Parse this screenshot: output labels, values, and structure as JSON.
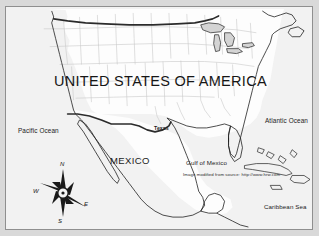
{
  "slide": {
    "background_color": "#d9d9d9",
    "plate_color": "#f2f2f2",
    "frame_color": "#8f8f8f"
  },
  "map": {
    "title": "UNITED STATES OF AMERICA",
    "countries": [
      {
        "name": "UNITED STATES OF AMERICA"
      },
      {
        "name": "MEXICO"
      }
    ],
    "country_usa": "UNITED STATES OF AMERICA",
    "country_mexico": "MEXICO",
    "state_label": "Texas",
    "water_bodies": {
      "pacific": "Pacific Ocean",
      "atlantic": "Atlantic Ocean",
      "gulf": "Gulf of Mexico",
      "caribbean": "Caribbean Sea"
    },
    "attribution": "Image modified from source: http://www.hrw.com",
    "compass": {
      "north": "N",
      "east": "E",
      "south": "S",
      "west": "W"
    },
    "colors": {
      "land_fill": "#fdfdfd",
      "state_border": "#c9c9c9",
      "coastline": "#1f1f1f",
      "national_border": "#2b2b2b",
      "lake_fill": "#d0d0d0",
      "text": "#1b1b1b"
    }
  }
}
